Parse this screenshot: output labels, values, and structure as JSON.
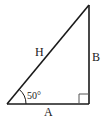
{
  "diagram": {
    "type": "right-triangle",
    "labels": {
      "hypotenuse": "H",
      "opposite": "B",
      "adjacent": "A",
      "angle": "50°"
    },
    "angle_degrees": 50,
    "right_angle_marker": true,
    "colors": {
      "stroke": "#1a1a1a",
      "marker": "#555555",
      "background": "#ffffff"
    }
  }
}
